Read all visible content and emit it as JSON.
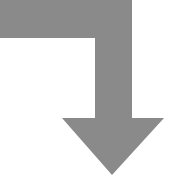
{
  "icon": {
    "name": "bent-arrow-down-icon",
    "fill_color": "#8a8a8a",
    "background": "#ffffff"
  }
}
